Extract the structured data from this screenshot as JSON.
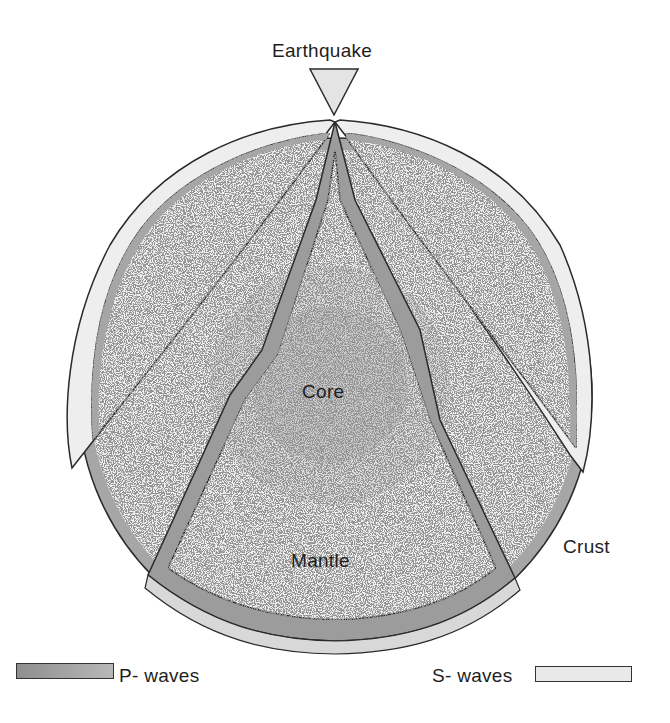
{
  "diagram": {
    "labels": {
      "earthquake": "Earthquake",
      "core": "Core",
      "mantle": "Mantle",
      "crust": "Crust"
    },
    "legend": [
      {
        "label": "P- waves",
        "color": "#9a9a9a"
      },
      {
        "label": "S- waves",
        "color": "#ececec"
      }
    ]
  },
  "colors": {
    "crust": "#a6a6a6",
    "mantle": "#f1f1f1",
    "outer_core": "#dcdcdc",
    "inner_core": "#c9c9c9",
    "p_wave": "#9a9a9a",
    "s_wave": "#ececec",
    "outline": "#2a2a2a"
  }
}
